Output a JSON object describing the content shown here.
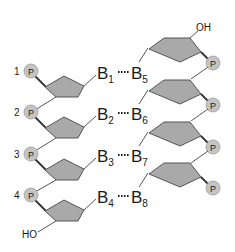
{
  "diagram": {
    "type": "dna-double-strand-schematic",
    "colors": {
      "sugar_fill": "#a9a9a9",
      "phosphate_fill": "#c4c4c4",
      "line": "#555555",
      "text": "#1a1a1a"
    },
    "left_strand": {
      "nucleotides": [
        {
          "number": "1",
          "phosphate": "P",
          "base": "B",
          "base_sub": "1"
        },
        {
          "number": "2",
          "phosphate": "P",
          "base": "B",
          "base_sub": "2"
        },
        {
          "number": "3",
          "phosphate": "P",
          "base": "B",
          "base_sub": "3"
        },
        {
          "number": "4",
          "phosphate": "P",
          "base": "B",
          "base_sub": "4"
        }
      ],
      "end_label": "HO"
    },
    "right_strand": {
      "nucleotides": [
        {
          "phosphate": "P",
          "base": "B",
          "base_sub": "5"
        },
        {
          "phosphate": "P",
          "base": "B",
          "base_sub": "6"
        },
        {
          "phosphate": "P",
          "base": "B",
          "base_sub": "7"
        },
        {
          "phosphate": "P",
          "base": "B",
          "base_sub": "8"
        }
      ],
      "end_label": "OH"
    },
    "pairs": [
      {
        "left": "B1",
        "right": "B5"
      },
      {
        "left": "B2",
        "right": "B6"
      },
      {
        "left": "B3",
        "right": "B7"
      },
      {
        "left": "B4",
        "right": "B8"
      }
    ]
  }
}
